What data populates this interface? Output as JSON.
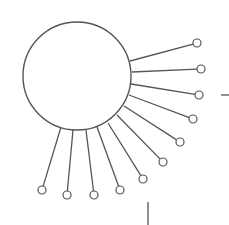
{
  "diagram": {
    "type": "hub-and-spoke",
    "stroke_color": "#555555",
    "background": "#ffffff",
    "hub": {
      "cx": 77,
      "cy": 76,
      "r": 54
    },
    "spokes": [
      {
        "from": [
          130,
          61
        ],
        "to": [
          197,
          43
        ]
      },
      {
        "from": [
          132,
          72
        ],
        "to": [
          201,
          69
        ]
      },
      {
        "from": [
          131,
          84
        ],
        "to": [
          199,
          95
        ]
      },
      {
        "from": [
          129,
          95
        ],
        "to": [
          193,
          119
        ]
      },
      {
        "from": [
          124,
          106
        ],
        "to": [
          180,
          142
        ]
      },
      {
        "from": [
          117,
          115
        ],
        "to": [
          163,
          162
        ]
      },
      {
        "from": [
          108,
          123
        ],
        "to": [
          143,
          179
        ]
      },
      {
        "from": [
          97,
          127
        ],
        "to": [
          120,
          190
        ]
      },
      {
        "from": [
          86,
          130
        ],
        "to": [
          94,
          195
        ]
      },
      {
        "from": [
          73,
          130
        ],
        "to": [
          67,
          195
        ]
      },
      {
        "from": [
          61,
          127
        ],
        "to": [
          42,
          190
        ]
      }
    ],
    "node_radius": 4,
    "marks": [
      {
        "x1": 221,
        "y1": 95,
        "x2": 229,
        "y2": 95
      },
      {
        "x1": 148,
        "y1": 202,
        "x2": 148,
        "y2": 225
      }
    ]
  }
}
